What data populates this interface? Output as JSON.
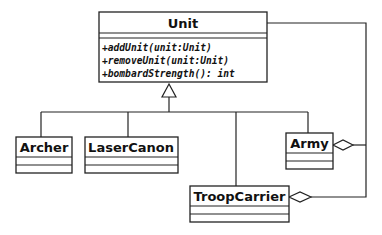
{
  "diagram": {
    "type": "UML class diagram",
    "classes": {
      "unit": {
        "name": "Unit",
        "operations": [
          "+addUnit(unit:Unit)",
          "+removeUnit(unit:Unit)",
          "+bombardStrength(): int"
        ]
      },
      "archer": {
        "name": "Archer"
      },
      "laser_canon": {
        "name": "LaserCanon"
      },
      "army": {
        "name": "Army"
      },
      "troop_carrier": {
        "name": "TroopCarrier"
      }
    },
    "relationships": [
      {
        "type": "generalization",
        "from": "Archer",
        "to": "Unit"
      },
      {
        "type": "generalization",
        "from": "LaserCanon",
        "to": "Unit"
      },
      {
        "type": "generalization",
        "from": "TroopCarrier",
        "to": "Unit"
      },
      {
        "type": "generalization",
        "from": "Army",
        "to": "Unit"
      },
      {
        "type": "aggregation",
        "whole": "Army",
        "part": "Unit"
      },
      {
        "type": "aggregation",
        "whole": "TroopCarrier",
        "part": "Unit"
      }
    ],
    "colors": {
      "stroke": "#222222",
      "background": "#ffffff",
      "text": "#111111"
    }
  }
}
